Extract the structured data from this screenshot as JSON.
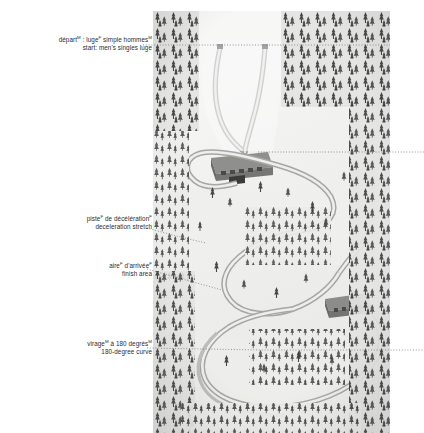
{
  "diagram": {
    "background_color": "#ffffff",
    "text_color": "#2b2b2b",
    "leader_style": "dotted",
    "illustration": {
      "name": "luge-track-aerial-illustration",
      "description": "Aerial grayscale illustration of a luge/bobsleigh track winding down a forested snow-covered mountainside",
      "x": 153,
      "y": 11,
      "width": 237,
      "height": 422,
      "snow_color": "#f2f2f1",
      "track_color": "#b9b9b7",
      "tree_color": "#4a4a4a",
      "building_color": "#6f6f6f"
    },
    "labels": [
      {
        "id": "start",
        "name": "label-start-mens-singles-luge",
        "fr": "départ",
        "fr_sup": "M",
        "fr_rest": " : luge",
        "fr_sup2": "F",
        "fr_rest2": " simple hommes",
        "fr_sup3": "M",
        "en": "start: men's singles luge",
        "leader_to_x": 390,
        "leader_to_y": 45
      },
      {
        "id": "deceleration",
        "name": "label-deceleration-stretch",
        "fr": "piste",
        "fr_sup": "F",
        "fr_rest": " de décélération",
        "fr_sup2": "F",
        "en": "deceleration stretch",
        "leader_to_x": 206,
        "leader_to_y": 243
      },
      {
        "id": "finish",
        "name": "label-finish-area",
        "fr": "aire",
        "fr_sup": "F",
        "fr_rest": " d'arrivée",
        "fr_sup2": "F",
        "en": "finish area",
        "leader_to_x": 222,
        "leader_to_y": 290
      },
      {
        "id": "curve",
        "name": "label-180-degree-curve",
        "fr": "virage",
        "fr_sup": "M",
        "fr_rest": " à 180 degrés",
        "fr_sup2": "M",
        "en": "180-degree curve",
        "leader_to_x": 390,
        "leader_to_y": 350
      }
    ],
    "callout_leaders_right_edge": [
      {
        "name": "leader-start",
        "y": 45
      },
      {
        "name": "leader-upper-right",
        "y": 152
      },
      {
        "name": "leader-curve",
        "y": 350
      }
    ]
  }
}
